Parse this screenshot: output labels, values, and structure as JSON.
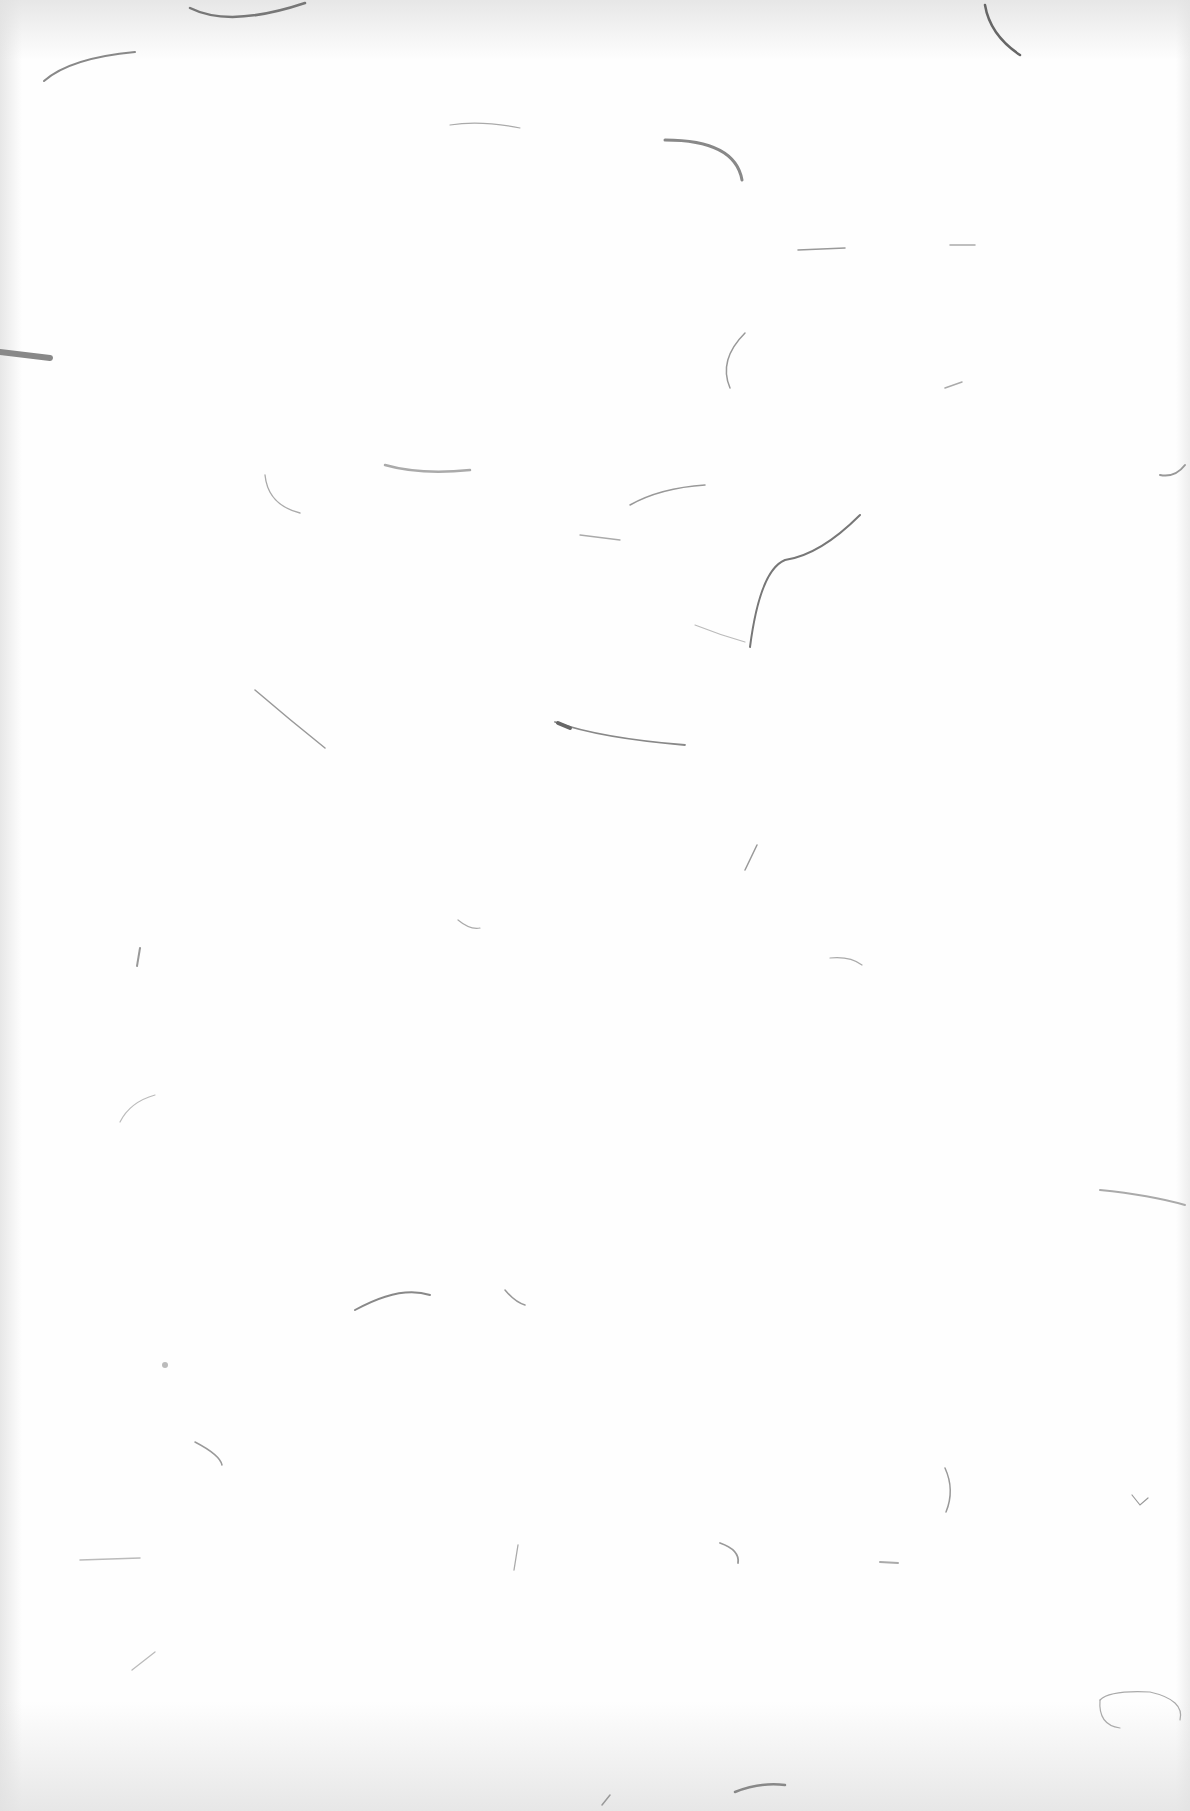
{
  "image": {
    "description": "Blank sheet of textured paper with scattered gray fibers",
    "background_color": "#fefefe",
    "fiber_color": "#8a8a8a",
    "text": ""
  }
}
